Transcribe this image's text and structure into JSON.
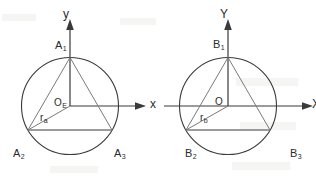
{
  "figure": {
    "type": "geometry-diagram",
    "panels": [
      {
        "id": "a",
        "axes": {
          "x_label": "x",
          "y_label": "y",
          "origin_label": "O",
          "origin_sub": "E"
        },
        "radius": {
          "label": "r",
          "sub": "a"
        },
        "vertices": [
          {
            "label": "A",
            "sub": "1",
            "position": "top"
          },
          {
            "label": "A",
            "sub": "2",
            "position": "bottom-left"
          },
          {
            "label": "A",
            "sub": "3",
            "position": "bottom-right"
          }
        ]
      },
      {
        "id": "b",
        "axes": {
          "x_label": "X",
          "y_label": "Y",
          "origin_label": "O",
          "origin_sub": ""
        },
        "radius": {
          "label": "r",
          "sub": "b"
        },
        "vertices": [
          {
            "label": "B",
            "sub": "1",
            "position": "top"
          },
          {
            "label": "B",
            "sub": "2",
            "position": "bottom-left"
          },
          {
            "label": "B",
            "sub": "3",
            "position": "bottom-right"
          }
        ]
      }
    ]
  },
  "colors": {
    "stroke": "#3a3a3a",
    "stroke_light": "#6e6e6e",
    "text": "#2b2b2b",
    "background": "#ffffff"
  }
}
